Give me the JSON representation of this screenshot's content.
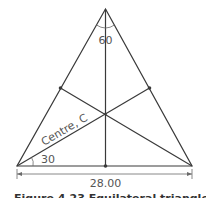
{
  "diagram": {
    "type": "equilateral-triangle-centroid",
    "labels": {
      "apex_angle": "60",
      "base_angle": "30",
      "centre": "Centre, C",
      "base_dimension": "28.00"
    },
    "caption": "Figure 4.23 Equilateral triangle",
    "colors": {
      "line": "#3a3a3a",
      "text": "#555555",
      "background": "#ffffff"
    }
  }
}
